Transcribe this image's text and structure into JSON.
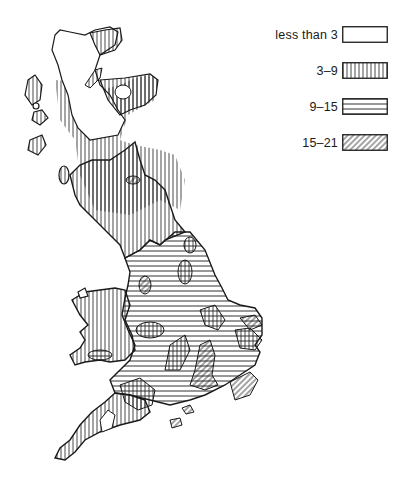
{
  "legend": {
    "items": [
      {
        "label": "less than 3",
        "pattern": "blank"
      },
      {
        "label": "3–9",
        "pattern": "vertical"
      },
      {
        "label": "9–15",
        "pattern": "horizontal"
      },
      {
        "label": "15–21",
        "pattern": "diagonal"
      }
    ]
  },
  "colors": {
    "ink": "#1a1a1a",
    "paper": "#ffffff"
  }
}
